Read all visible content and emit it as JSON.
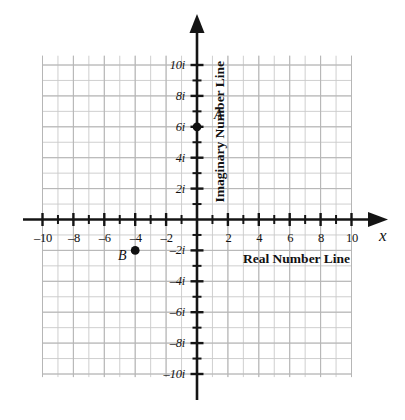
{
  "chart_data": {
    "type": "scatter",
    "title": "",
    "subtitle": "",
    "xlabel": "Real Number Line",
    "ylabel": "Imaginary Number Line",
    "x_axis_variable": "x",
    "xlim": [
      -11,
      11
    ],
    "ylim": [
      -11,
      11
    ],
    "grid": true,
    "grid_step": 1,
    "legend": "none",
    "x_ticks": [
      -10,
      -8,
      -6,
      -4,
      -2,
      2,
      4,
      6,
      8,
      10
    ],
    "x_tick_labels": [
      "–10",
      "–8",
      "–6",
      "–4",
      "–2",
      "2",
      "4",
      "6",
      "8",
      "10"
    ],
    "y_ticks": [
      10,
      8,
      6,
      4,
      2,
      -2,
      -4,
      -6,
      -8,
      -10
    ],
    "y_tick_labels": [
      "10i",
      "8i",
      "6i",
      "4i",
      "2i",
      "–2i",
      "–4i",
      "–6i",
      "–8i",
      "–10i"
    ],
    "minor_tick_step": 1,
    "points": [
      {
        "name": "A",
        "label": "A",
        "x": 0,
        "y": 6,
        "label_side": "right",
        "annotation": "6i"
      },
      {
        "name": "B",
        "label": "B",
        "x": -4,
        "y": -2,
        "label_side": "left",
        "annotation": "–4 – 2i"
      }
    ],
    "colors": {
      "grid": "#c9c9c9",
      "axis": "#141414",
      "point": "#101010",
      "text": "#111111",
      "background": "#ffffff"
    }
  },
  "axes": {
    "real_label": "Real Number Line",
    "imaginary_label": "Imaginary Number Line",
    "x_variable": "x"
  },
  "points": {
    "a_label": "A",
    "b_label": "B"
  }
}
